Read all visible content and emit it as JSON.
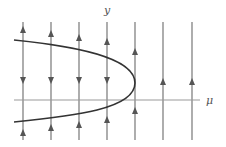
{
  "diagram": {
    "labels": {
      "y_axis": "y",
      "x_axis": "μ"
    },
    "colors": {
      "lines": "#777777",
      "axis": "#999999",
      "curve": "#333333",
      "arrow": "#555555"
    },
    "axis": {
      "y": 100,
      "x_start": 14,
      "x_end": 200
    },
    "vertical_lines": {
      "y_top": 22,
      "y_bottom": 140,
      "xs": [
        23,
        51,
        79,
        107,
        135,
        163,
        192
      ]
    },
    "curve": {
      "vertex": [
        135,
        83
      ],
      "top_end": [
        14,
        40
      ],
      "bottom_end": [
        14,
        122
      ]
    },
    "arrows": [
      {
        "x": 23,
        "y": 30,
        "dir": "up"
      },
      {
        "x": 23,
        "y": 80,
        "dir": "down"
      },
      {
        "x": 23,
        "y": 133,
        "dir": "up"
      },
      {
        "x": 51,
        "y": 34,
        "dir": "up"
      },
      {
        "x": 51,
        "y": 80,
        "dir": "down"
      },
      {
        "x": 51,
        "y": 128,
        "dir": "up"
      },
      {
        "x": 79,
        "y": 38,
        "dir": "up"
      },
      {
        "x": 79,
        "y": 80,
        "dir": "down"
      },
      {
        "x": 79,
        "y": 125,
        "dir": "up"
      },
      {
        "x": 107,
        "y": 42,
        "dir": "up"
      },
      {
        "x": 107,
        "y": 80,
        "dir": "down"
      },
      {
        "x": 107,
        "y": 120,
        "dir": "up"
      },
      {
        "x": 135,
        "y": 52,
        "dir": "up"
      },
      {
        "x": 135,
        "y": 111,
        "dir": "up"
      },
      {
        "x": 163,
        "y": 82,
        "dir": "up"
      },
      {
        "x": 192,
        "y": 82,
        "dir": "up"
      }
    ]
  }
}
